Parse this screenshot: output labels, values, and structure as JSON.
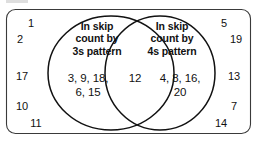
{
  "diagram": {
    "type": "venn-diagram",
    "sets": [
      {
        "id": "left",
        "label_lines": [
          "In skip",
          "count by",
          "3s pattern"
        ],
        "label_text": "In skip count by 3s pattern",
        "values_lines": [
          "3, 9, 18,",
          "6, 15"
        ],
        "values": [
          3,
          9,
          18,
          6,
          15
        ]
      },
      {
        "id": "right",
        "label_lines": [
          "In skip",
          "count by",
          "4s pattern"
        ],
        "label_text": "In skip count by 4s pattern",
        "values_lines": [
          "4, 8, 16,",
          "20"
        ],
        "values": [
          4,
          8,
          16,
          20
        ]
      }
    ],
    "intersection": {
      "values_lines": [
        "12"
      ],
      "values": [
        12
      ]
    },
    "outside": {
      "left_values": [
        "1",
        "2",
        "17",
        "10",
        "11"
      ],
      "right_values": [
        "5",
        "19",
        "13",
        "7",
        "14"
      ]
    },
    "colors": {
      "stroke": "#111111",
      "frame_stroke": "#3a3a3a",
      "background": "#ffffff",
      "text": "#111111"
    }
  }
}
